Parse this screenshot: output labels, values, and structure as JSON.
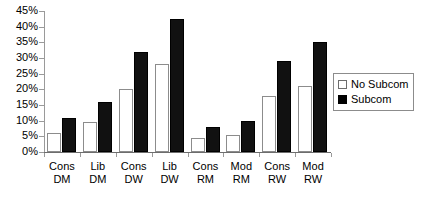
{
  "chart_data": {
    "type": "bar",
    "title": "",
    "xlabel": "",
    "ylabel": "",
    "ylim": [
      0,
      45
    ],
    "ytick_labels": [
      "45%",
      "40%",
      "35%",
      "30%",
      "25%",
      "20%",
      "15%",
      "10%",
      "5%",
      "0%"
    ],
    "ytick_values": [
      45,
      40,
      35,
      30,
      25,
      20,
      15,
      10,
      5,
      0
    ],
    "grid": false,
    "legend_position": "right",
    "categories": [
      {
        "line1": "Cons",
        "line2": "DM"
      },
      {
        "line1": "Lib",
        "line2": "DM"
      },
      {
        "line1": "Cons",
        "line2": "DW"
      },
      {
        "line1": "Lib",
        "line2": "DW"
      },
      {
        "line1": "Cons",
        "line2": "RM"
      },
      {
        "line1": "Mod",
        "line2": "RM"
      },
      {
        "line1": "Cons",
        "line2": "RW"
      },
      {
        "line1": "Mod",
        "line2": "RW"
      }
    ],
    "category_labels": [
      "Cons DM",
      "Lib DM",
      "Cons DW",
      "Lib DW",
      "Cons RM",
      "Mod RM",
      "Cons RW",
      "Mod RW"
    ],
    "series": [
      {
        "name": "No Subcom",
        "color": "#ffffff",
        "values": [
          6,
          9.5,
          20,
          28,
          4.5,
          5.5,
          18,
          21
        ]
      },
      {
        "name": "Subcom",
        "color": "#000000",
        "values": [
          11,
          16,
          32,
          42.5,
          8,
          10,
          29,
          35
        ]
      }
    ]
  },
  "legend": {
    "items": [
      {
        "label": "No Subcom",
        "swatch": "empty-square"
      },
      {
        "label": "Subcom",
        "swatch": "filled-square"
      }
    ]
  }
}
